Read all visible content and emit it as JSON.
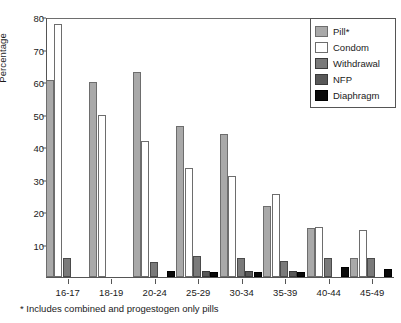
{
  "chart_data": {
    "type": "bar",
    "title": "",
    "subtitle": "",
    "xlabel": "",
    "ylabel": "Percentage",
    "ylim": [
      0,
      80
    ],
    "yticks": [
      10,
      20,
      30,
      40,
      50,
      60,
      70,
      80
    ],
    "grid": false,
    "legend_position": "top-right",
    "categories": [
      "16-17",
      "18-19",
      "20-24",
      "25-29",
      "30-34",
      "35-39",
      "40-44",
      "45-49"
    ],
    "series": [
      {
        "name": "Pill*",
        "color": "#a9a9a9",
        "values": [
          60.5,
          60.0,
          63.0,
          46.5,
          44.0,
          22.0,
          15.0,
          6.0
        ]
      },
      {
        "name": "Condom",
        "color": "#ffffff",
        "values": [
          78.0,
          50.0,
          42.0,
          33.5,
          31.0,
          25.5,
          15.5,
          14.5
        ]
      },
      {
        "name": "Withdrawal",
        "color": "#7a7a7a",
        "values": [
          6.0,
          0.0,
          4.5,
          6.5,
          6.0,
          5.0,
          6.0,
          6.0
        ]
      },
      {
        "name": "NFP",
        "color": "#585858",
        "values": [
          0.0,
          0.0,
          0.0,
          2.0,
          2.0,
          2.0,
          0.0,
          0.0
        ]
      },
      {
        "name": "Diaphragm",
        "color": "#0a0a0a",
        "values": [
          0.0,
          0.0,
          2.0,
          1.5,
          1.5,
          1.5,
          3.0,
          2.5
        ]
      }
    ],
    "footnote": "* Includes combined and progestogen only pills"
  },
  "legend": {
    "items": [
      {
        "label": "Pill*"
      },
      {
        "label": "Condom"
      },
      {
        "label": "Withdrawal"
      },
      {
        "label": "NFP"
      },
      {
        "label": "Diaphragm"
      }
    ]
  }
}
